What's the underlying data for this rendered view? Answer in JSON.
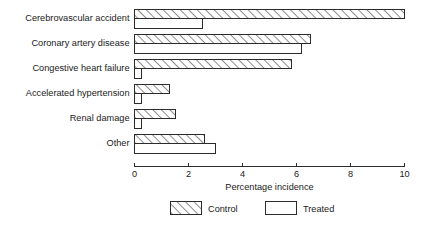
{
  "chart_data": {
    "type": "bar",
    "orientation": "horizontal",
    "title": "",
    "xlabel": "Percentage incidence",
    "ylabel": "",
    "xlim": [
      0,
      10
    ],
    "xticks": [
      0,
      2,
      4,
      6,
      8,
      10
    ],
    "xtick_labels": [
      "0",
      "2",
      "4",
      "6",
      "8",
      "10"
    ],
    "grid": false,
    "legend_position": "bottom",
    "categories": [
      "Cerebrovascular accident",
      "Coronary  artery disease",
      "Congestive heart failure",
      "Accelerated hypertension",
      "Renal damage",
      "Other"
    ],
    "series": [
      {
        "name": "Control",
        "fill": "hatched-diagonal",
        "values": [
          10.0,
          6.5,
          5.8,
          1.3,
          1.5,
          2.6
        ]
      },
      {
        "name": "Treated",
        "fill": "white",
        "values": [
          2.5,
          6.2,
          0.25,
          0.25,
          0.25,
          3.0
        ]
      }
    ]
  },
  "legend": {
    "items": [
      {
        "label": "Control",
        "swatch": "hatched-diagonal"
      },
      {
        "label": "Treated",
        "swatch": "white"
      }
    ]
  },
  "colors": {
    "ink": "#2b2b2b",
    "background": "#ffffff",
    "hatch": "#3a3a3a"
  }
}
